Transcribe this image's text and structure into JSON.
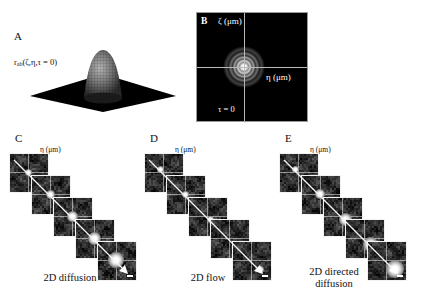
{
  "figure": {
    "background_color": "#ffffff",
    "panel_letters": [
      "A",
      "B",
      "C",
      "D",
      "E"
    ]
  },
  "panel_a": {
    "letter": "A",
    "formula_main": "r",
    "formula_sub": "ab",
    "formula_args": "(ζ,η,τ = 0)",
    "plot_type": "3d-surface",
    "description": "Gaussian peak on square base plane",
    "surface_color": "#000000",
    "peak_color": "#8a8a8a"
  },
  "panel_b": {
    "letter": "B",
    "y_axis_label": "ζ (μm)",
    "x_axis_label": "η (μm)",
    "tau_label": "τ = 0",
    "background_color": "#000000",
    "axis_color": "#b9b9b9",
    "spot_description": "central airy-ring correlation peak"
  },
  "panel_c": {
    "letter": "C",
    "x_axis_label": "η (μm)",
    "y_axis_label": "ζ (μm)",
    "caption": "2D diffusion",
    "frame_count": 5,
    "blob_sizes": [
      7,
      9,
      11,
      13,
      16
    ],
    "blob_offsets_x": [
      0,
      0,
      0,
      0,
      0
    ],
    "blob_offsets_y": [
      0,
      0,
      0,
      0,
      0
    ],
    "scalebar": true
  },
  "panel_d": {
    "letter": "D",
    "x_axis_label": "η (μm)",
    "y_axis_label": "ζ (μm)",
    "caption": "2D flow",
    "frame_count": 5,
    "blob_sizes": [
      7,
      7,
      7,
      7,
      7
    ],
    "blob_offsets_x": [
      -3,
      0,
      3,
      6,
      9
    ],
    "blob_offsets_y": [
      -3,
      0,
      3,
      6,
      9
    ],
    "scalebar": true
  },
  "panel_e": {
    "letter": "E",
    "x_axis_label": "η (μm)",
    "y_axis_label": "ζ (μm)",
    "caption_line1": "2D directed",
    "caption_line2": "diffusion",
    "frame_count": 5,
    "blob_sizes": [
      7,
      10,
      13,
      15,
      18
    ],
    "blob_offsets_x": [
      -3,
      0,
      3,
      6,
      9
    ],
    "blob_offsets_y": [
      -3,
      0,
      3,
      6,
      9
    ],
    "scalebar": true
  }
}
